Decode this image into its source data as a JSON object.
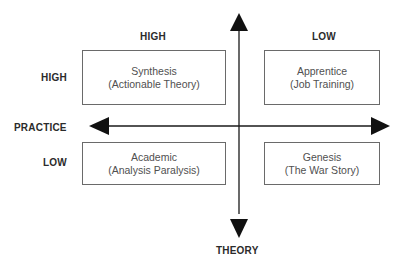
{
  "diagram": {
    "axes": {
      "horizontal_label": "PRACTICE",
      "vertical_label": "THEORY"
    },
    "column_headers": [
      "HIGH",
      "LOW"
    ],
    "row_headers": [
      "HIGH",
      "LOW"
    ],
    "quadrants": [
      {
        "position": "top-left",
        "title": "Synthesis",
        "subtitle": "(Actionable Theory)"
      },
      {
        "position": "top-right",
        "title": "Apprentice",
        "subtitle": "(Job Training)"
      },
      {
        "position": "bottom-left",
        "title": "Academic",
        "subtitle": "(Analysis Paralysis)"
      },
      {
        "position": "bottom-right",
        "title": "Genesis",
        "subtitle": "(The War Story)"
      }
    ],
    "colors": {
      "line": "#1a1a1a",
      "box_border": "#6a6a6a",
      "text": "#2b2b2b"
    }
  }
}
